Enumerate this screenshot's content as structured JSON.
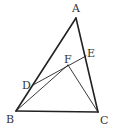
{
  "diagram": {
    "type": "geometry-triangle",
    "stroke_color": "#222222",
    "points": {
      "A": {
        "label": "A",
        "x": 76,
        "y": 18,
        "lx": 72,
        "ly": 12
      },
      "B": {
        "label": "B",
        "x": 16,
        "y": 111,
        "lx": 6,
        "ly": 123
      },
      "C": {
        "label": "C",
        "x": 98,
        "y": 112,
        "lx": 100,
        "ly": 124
      },
      "D": {
        "label": "D",
        "x": 33,
        "y": 85,
        "lx": 22,
        "ly": 89
      },
      "E": {
        "label": "E",
        "x": 86,
        "y": 56,
        "lx": 87,
        "ly": 57
      },
      "F": {
        "label": "F",
        "x": 68,
        "y": 65,
        "lx": 64,
        "ly": 63
      }
    },
    "segments": [
      {
        "from": "A",
        "to": "B",
        "weight": 1.6
      },
      {
        "from": "A",
        "to": "C",
        "weight": 1.6
      },
      {
        "from": "B",
        "to": "C",
        "weight": 1.6
      },
      {
        "from": "D",
        "to": "E",
        "weight": 0.9
      },
      {
        "from": "B",
        "to": "F",
        "weight": 0.9
      },
      {
        "from": "F",
        "to": "C",
        "weight": 0.9
      }
    ]
  }
}
